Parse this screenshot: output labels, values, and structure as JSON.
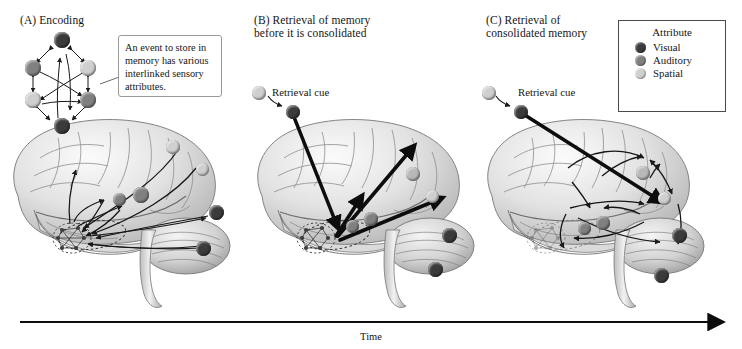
{
  "figure": {
    "title_implicit": "Memory encoding, retrieval before consolidation, and retrieval of consolidated memory",
    "time_axis_label": "Time"
  },
  "panels": [
    {
      "id": "A",
      "label": "(A)  Encoding",
      "callout_text": "An event to store in memory has various interlinked sensory attributes.",
      "network_nodes": [
        {
          "position": "top",
          "attribute": "Visual"
        },
        {
          "position": "upper-left",
          "attribute": "Auditory"
        },
        {
          "position": "upper-right",
          "attribute": "Spatial"
        },
        {
          "position": "lower-left",
          "attribute": "Spatial"
        },
        {
          "position": "lower-right",
          "attribute": "Auditory"
        },
        {
          "position": "bottom",
          "attribute": "Visual"
        }
      ],
      "cortical_nodes": [
        {
          "region": "parietal-superior",
          "attribute": "Spatial"
        },
        {
          "region": "parietal-inferior",
          "attribute": "Spatial"
        },
        {
          "region": "frontal-posterior",
          "attribute": "Auditory"
        },
        {
          "region": "temporal-superior",
          "attribute": "Auditory"
        },
        {
          "region": "occipital-superior",
          "attribute": "Visual"
        },
        {
          "region": "occipital-inferior",
          "attribute": "Visual"
        }
      ],
      "arrow_direction": "cortex-to-hippocampus",
      "arrow_weight": "thin"
    },
    {
      "id": "B",
      "label": "(B)  Retrieval of memory\nbefore it is consolidated",
      "cue_label": "Retrieval cue",
      "cortical_nodes": [
        {
          "region": "parietal-superior",
          "attribute": "Spatial"
        },
        {
          "region": "parietal-inferior",
          "attribute": "Spatial"
        },
        {
          "region": "frontal-posterior",
          "attribute": "Auditory"
        },
        {
          "region": "temporal-superior",
          "attribute": "Auditory"
        },
        {
          "region": "occipital-superior",
          "attribute": "Visual"
        },
        {
          "region": "occipital-inferior",
          "attribute": "Visual"
        }
      ],
      "arrow_direction": "hippocampus-to-cortex",
      "arrow_weight": "thick"
    },
    {
      "id": "C",
      "label": "(C)  Retrieval of\nconsolidated memory",
      "cue_label": "Retrieval cue",
      "cortical_nodes": [
        {
          "region": "parietal-superior",
          "attribute": "Spatial"
        },
        {
          "region": "parietal-inferior",
          "attribute": "Spatial"
        },
        {
          "region": "frontal-posterior",
          "attribute": "Auditory"
        },
        {
          "region": "temporal-superior",
          "attribute": "Auditory"
        },
        {
          "region": "occipital-superior",
          "attribute": "Visual"
        },
        {
          "region": "occipital-inferior",
          "attribute": "Visual"
        }
      ],
      "arrow_direction": "cortex-to-cortex",
      "arrow_weight": "thin",
      "hippocampus_state": "faded"
    }
  ],
  "legend": {
    "title": "Attribute",
    "items": [
      {
        "label": "Visual",
        "color": "#3b3b3b"
      },
      {
        "label": "Auditory",
        "color": "#808080"
      },
      {
        "label": "Spatial",
        "color": "#cfcfcf"
      }
    ]
  },
  "colors": {
    "visual": "#3b3b3b",
    "auditory": "#808080",
    "spatial": "#cfcfcf",
    "line": "#1a1a1a",
    "brain_light": "#f2f2f2",
    "brain_mid": "#c9c9c9",
    "brain_dark": "#8f8f8f",
    "background": "#ffffff"
  }
}
